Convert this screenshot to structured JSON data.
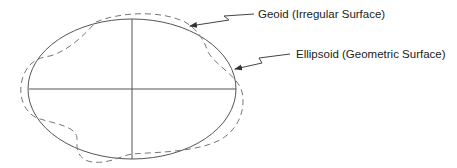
{
  "diagram": {
    "labels": {
      "geoid": "Geoid (Irregular Surface)",
      "ellipsoid": "Ellipsoid (Geometric Surface)"
    },
    "colors": {
      "ellipsoid_stroke": "#555555",
      "geoid_stroke": "#777777",
      "leader_stroke": "#444444",
      "text": "#222222"
    }
  }
}
